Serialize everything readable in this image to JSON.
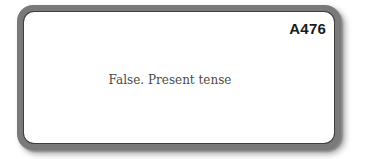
{
  "card": {
    "id_label": "A476",
    "text": "False. Present tense",
    "colors": {
      "border": "#7a7a7a",
      "background": "#ffffff",
      "text": "#4a4a4a",
      "id": "#1a1a1a"
    }
  }
}
